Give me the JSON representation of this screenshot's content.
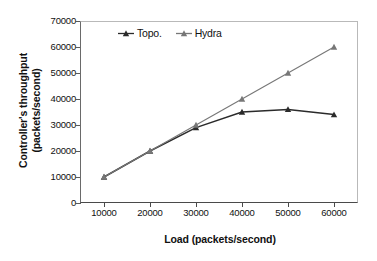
{
  "chart_data": {
    "type": "line",
    "title": "",
    "xlabel": "Load (packets/second)",
    "ylabel": "Controller's throughput\n(packets/second)",
    "x": [
      10000,
      20000,
      30000,
      40000,
      50000,
      60000
    ],
    "xticklabels": [
      "10000",
      "20000",
      "30000",
      "40000",
      "50000",
      "60000"
    ],
    "yticklabels": [
      "0",
      "10000",
      "20000",
      "30000",
      "40000",
      "50000",
      "60000",
      "70000"
    ],
    "yticks": [
      0,
      10000,
      20000,
      30000,
      40000,
      50000,
      60000,
      70000
    ],
    "xlim": [
      5000,
      65000
    ],
    "ylim": [
      0,
      70000
    ],
    "grid": "horizontal-dotted",
    "legend_position": "upper-left-inside",
    "series": [
      {
        "name": "Topo.",
        "color": "#2b2b2b",
        "marker": "triangle",
        "values": [
          10000,
          20000,
          29000,
          35000,
          36000,
          34000
        ]
      },
      {
        "name": "Hydra",
        "color": "#777777",
        "marker": "triangle",
        "values": [
          10000,
          20000,
          30000,
          40000,
          50000,
          60000
        ]
      }
    ]
  }
}
